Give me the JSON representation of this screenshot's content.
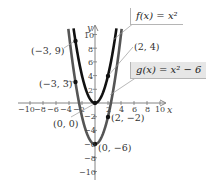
{
  "chart_data": {
    "type": "line",
    "title": "",
    "xlabel": "x",
    "ylabel": "y",
    "xlim": [
      -10,
      10
    ],
    "ylim": [
      -10,
      10
    ],
    "x_ticks": [
      -10,
      -8,
      -6,
      -4,
      -2,
      2,
      4,
      6,
      8,
      10
    ],
    "y_ticks": [
      10,
      8,
      6,
      4,
      2,
      -2,
      -4,
      -6,
      -8,
      -10
    ],
    "grid": false,
    "series": [
      {
        "name": "f(x) = x^2",
        "label": "f(x) = x²",
        "expression": "x^2",
        "color": "#111111",
        "points": [
          [
            -3,
            9
          ],
          [
            0,
            0
          ],
          [
            2,
            4
          ]
        ]
      },
      {
        "name": "g(x) = x^2 - 6",
        "label": "g(x) = x² − 6",
        "expression": "x^2 - 6",
        "color": "#4a4a4a",
        "points": [
          [
            -3,
            3
          ],
          [
            0,
            -6
          ],
          [
            2,
            -2
          ]
        ]
      }
    ],
    "annotations": [
      {
        "text": "(−3, 9)",
        "x": -3,
        "y": 9
      },
      {
        "text": "(−3, 3)",
        "x": -3,
        "y": 3
      },
      {
        "text": "(0, 0)",
        "x": 0,
        "y": 0
      },
      {
        "text": "(2, 4)",
        "x": 2,
        "y": 4
      },
      {
        "text": "(2, −2)",
        "x": 2,
        "y": -2
      },
      {
        "text": "(0, −6)",
        "x": 0,
        "y": -6
      }
    ]
  },
  "axes": {
    "x_name": "x",
    "y_name": "y",
    "x_tick_labels": [
      "−10",
      "−8",
      "−6",
      "−4",
      "−2",
      "2",
      "4",
      "6",
      "8",
      "10"
    ],
    "y_tick_labels": [
      "10",
      "8",
      "6",
      "4",
      "2",
      "−2",
      "−4",
      "−6",
      "−8",
      "−10"
    ]
  },
  "legend": {
    "f_label": "f(x) = x²",
    "g_label": "g(x) = x² − 6"
  },
  "points": {
    "p1": "(−3, 9)",
    "p2": "(−3, 3)",
    "p3": "(0, 0)",
    "p4": "(2, 4)",
    "p5": "(2, −2)",
    "p6": "(0, −6)"
  }
}
